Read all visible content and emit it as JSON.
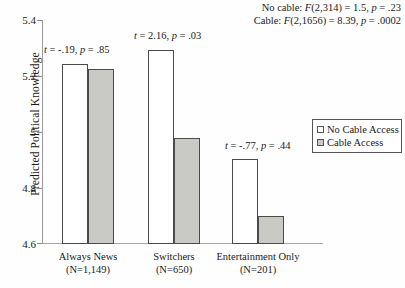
{
  "chart_data": {
    "type": "bar",
    "title": "",
    "xlabel": "",
    "ylabel": "Predicted Political Knowledge",
    "ylim": [
      4.6,
      5.4
    ],
    "yticks": [
      "5.4",
      "5.2",
      "5",
      "4.8",
      "4.6"
    ],
    "ytick_values": [
      5.4,
      5.2,
      5.0,
      4.8,
      4.6
    ],
    "grid": false,
    "legend_position": "right",
    "categories": [
      "Always News",
      "Switchers",
      "Entertainment Only"
    ],
    "category_counts": [
      "(N=1,149)",
      "(N=650)",
      "(N=201)"
    ],
    "series": [
      {
        "name": "No Cable Access",
        "values": [
          5.24,
          5.29,
          4.905
        ],
        "color": "#ffffff"
      },
      {
        "name": "Cable Access",
        "values": [
          5.22,
          4.98,
          4.715
        ],
        "color": "#c9c9c5"
      }
    ],
    "annotations": [
      {
        "id": "t-always-news",
        "text": "t = -.19, p = .85",
        "t": -0.19,
        "p": 0.85
      },
      {
        "id": "t-switchers",
        "text": "t = 2.16, p = .03",
        "t": 2.16,
        "p": 0.03
      },
      {
        "id": "t-entertainment-only",
        "text": "t = -.77, p = .44",
        "t": -0.77,
        "p": 0.44
      }
    ],
    "statistics": [
      {
        "id": "f-no-cable",
        "text": "No cable: F(2,314) = 1.5, p = .23"
      },
      {
        "id": "f-cable",
        "text": "Cable: F(2,1656) = 8.39, p = .0002"
      }
    ]
  },
  "axis": {
    "ylabel": "Predicted Political Knowledge",
    "ytick_0": "5.4",
    "ytick_1": "5.2",
    "ytick_2": "5",
    "ytick_3": "4.8",
    "ytick_4": "4.6"
  },
  "legend": {
    "items": [
      {
        "label": "No Cable Access",
        "swatch": "white"
      },
      {
        "label": "Cable Access",
        "swatch": "gray"
      }
    ]
  },
  "xlabels": [
    {
      "name": "Always News",
      "count": "(N=1,149)"
    },
    {
      "name": "Switchers",
      "count": "(N=650)"
    },
    {
      "name": "Entertainment Only",
      "count": "(N=201)"
    }
  ],
  "notes": {
    "t_always_news": "t = -.19, p = .85",
    "t_switchers": "t = 2.16, p = .03",
    "t_entertainment": "t = -.77, p = .44",
    "f_no_cable": "No cable: F(2,314) = 1.5, p = .23",
    "f_cable": "Cable: F(2,1656) = 8.39, p = .0002"
  },
  "colors": {
    "bar_white": "#ffffff",
    "bar_gray": "#c9c9c5",
    "bar_border": "#4b4b4b",
    "axis": "#9a9a9a",
    "text": "#1a1a1a"
  }
}
